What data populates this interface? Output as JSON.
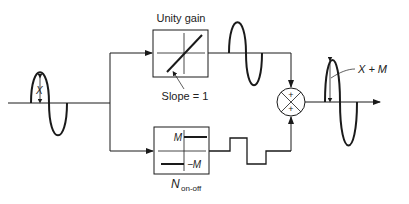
{
  "diagram": {
    "type": "block-diagram",
    "input_signal": {
      "amplitude_label": "X"
    },
    "blocks": [
      {
        "id": "unity",
        "title": "Unity gain",
        "annotation": "Slope = 1"
      },
      {
        "id": "onoff",
        "title_main": "N",
        "title_sub": "on-off",
        "level_pos": "M",
        "level_neg": "−M"
      }
    ],
    "summing_junction": {
      "top_sign": "+",
      "bottom_sign": "+"
    },
    "output_signal": {
      "amplitude_label": "X + M"
    }
  },
  "colors": {
    "line": "#1a1a1a",
    "background": "#ffffff"
  }
}
